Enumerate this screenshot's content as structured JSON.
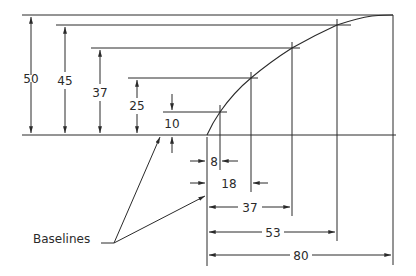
{
  "diagram": {
    "title": "",
    "callout_label": "Baselines",
    "vertical_dimensions": [
      {
        "label": "50",
        "value": 50
      },
      {
        "label": "45",
        "value": 45
      },
      {
        "label": "37",
        "value": 37
      },
      {
        "label": "25",
        "value": 25
      },
      {
        "label": "10",
        "value": 10
      }
    ],
    "horizontal_dimensions": [
      {
        "label": "8",
        "value": 8
      },
      {
        "label": "18",
        "value": 18
      },
      {
        "label": "37",
        "value": 37
      },
      {
        "label": "53",
        "value": 53
      },
      {
        "label": "80",
        "value": 80
      }
    ],
    "curve_points": [
      {
        "x": 0,
        "y": 0
      },
      {
        "x": 8,
        "y": 10
      },
      {
        "x": 18,
        "y": 25
      },
      {
        "x": 37,
        "y": 37
      },
      {
        "x": 53,
        "y": 45
      },
      {
        "x": 80,
        "y": 50
      }
    ],
    "line_color": "#2a2a2a",
    "background": "#ffffff"
  }
}
